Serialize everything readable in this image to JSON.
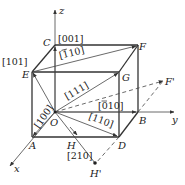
{
  "diagram": {
    "axes": {
      "x": "x",
      "y": "y",
      "z": "z"
    },
    "points": {
      "O": "O",
      "A": "A",
      "B": "B",
      "C": "C",
      "D": "D",
      "E": "E",
      "F": "F",
      "G": "G",
      "H": "H",
      "F_prime": "F'",
      "H_prime": "H'"
    },
    "directions": {
      "d001": "[001]",
      "d101": "[101]",
      "d1bar10_bar": "1",
      "d1bar10_rest": "10]",
      "d1bar10_open": "[",
      "d111": "[111]",
      "d0bar10_open": "[",
      "d0bar10_bar": "0",
      "d0bar10_rest": "10]",
      "d100": "[100]",
      "d110": "[110]",
      "d210": "[210]"
    },
    "colors": {
      "line": "#333333",
      "text": "#222222",
      "background": "#ffffff"
    }
  }
}
